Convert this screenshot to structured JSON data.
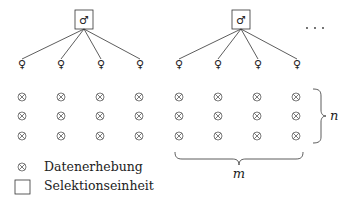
{
  "diagram": {
    "type": "cluster-sampling-schematic",
    "selection_unit_symbol": "♂",
    "member_symbol": "♀",
    "data_point_symbol": "⊗",
    "continuation": "· · ·",
    "groups": [
      {
        "box_x": 84,
        "members_x": [
          22,
          61,
          101,
          140
        ]
      },
      {
        "box_x": 241,
        "members_x": [
          179,
          218,
          258,
          297
        ]
      }
    ],
    "grid": {
      "columns_x": [
        22,
        61,
        100,
        139,
        179,
        218,
        257,
        296
      ],
      "rows_y": [
        97,
        116,
        136
      ]
    },
    "brace_labels": {
      "rows": "n",
      "columns": "m"
    }
  },
  "legend": {
    "items": [
      {
        "symbol": "data-point",
        "label": "Datenerhebung"
      },
      {
        "symbol": "selection-unit",
        "label": "Selektionseinheit"
      }
    ]
  },
  "colors": {
    "stroke": "#333333",
    "text": "#222222",
    "background": "#ffffff"
  }
}
